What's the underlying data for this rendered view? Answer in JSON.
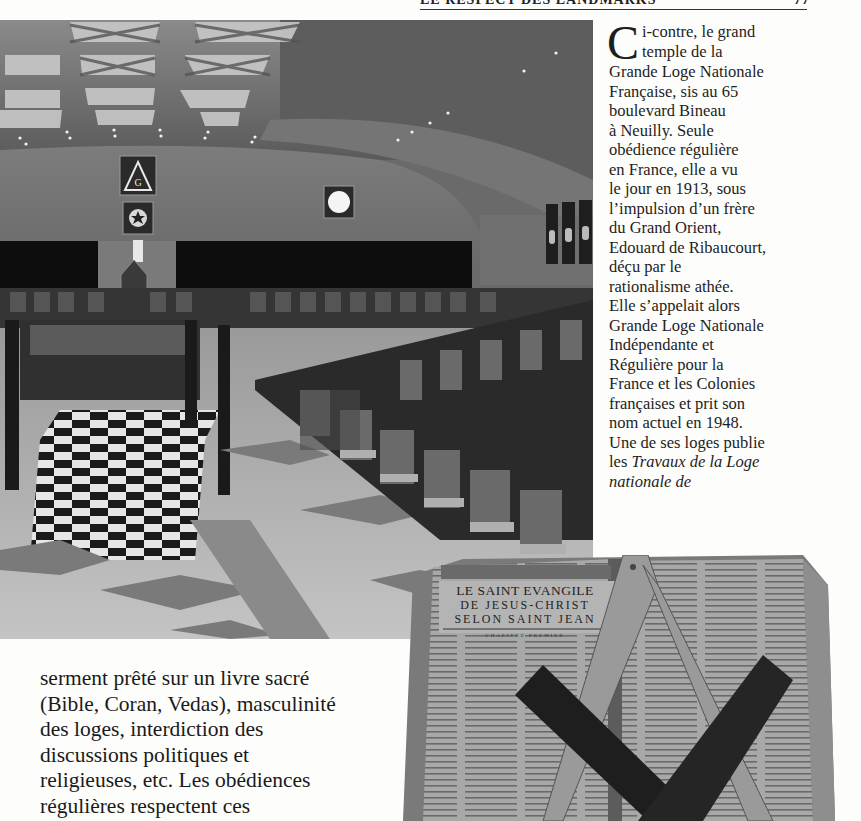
{
  "running_header": {
    "title": "LE RESPECT DES LANDMARKS",
    "page_number": "77"
  },
  "temple_photo": {
    "alt": "Grand temple de la Grande Loge Nationale Française, boulevard Bineau à Neuilly",
    "icons": [
      "delta-g-emblem",
      "blazing-star-emblem",
      "sun-emblem",
      "banners"
    ]
  },
  "caption": {
    "dropcap": "C",
    "lines": [
      "i-contre, le grand",
      "temple de la",
      "Grande Loge Nationale",
      "Française, sis au 65",
      "boulevard Bineau",
      "à Neuilly. Seule",
      "obédience régulière",
      "en France, elle a vu",
      "le jour en 1913, sous",
      "l’impulsion d’un frère",
      "du Grand Orient,",
      "Edouard de Ribaucourt,",
      "déçu par le",
      "rationalisme athée.",
      "Elle s’appelait alors",
      "Grande Loge Nationale",
      "Indépendante et",
      "Régulière pour la",
      "France et les Colonies",
      "françaises et prit son",
      "nom actuel en 1948.",
      "Une de ses loges publie"
    ],
    "line_italic_prefix": "les ",
    "line_italic_text": "Travaux de la Loge",
    "last_line_italic": "nationale de"
  },
  "body_text": {
    "lines": [
      "serment prêté sur un livre sacré",
      "(Bible, Coran, Vedas), masculinité",
      "des loges, interdiction des",
      "discussions politiques et",
      "religieuses, etc. Les obédiences",
      "régulières respectent ces"
    ]
  },
  "book_photo": {
    "title_lines": [
      "LE SAINT EVANGILE",
      "DE JESUS-CHRIST",
      "SELON SAINT JEAN"
    ],
    "chapter": "CHAPITRE PREMIER",
    "objects": [
      "compass",
      "square"
    ]
  }
}
